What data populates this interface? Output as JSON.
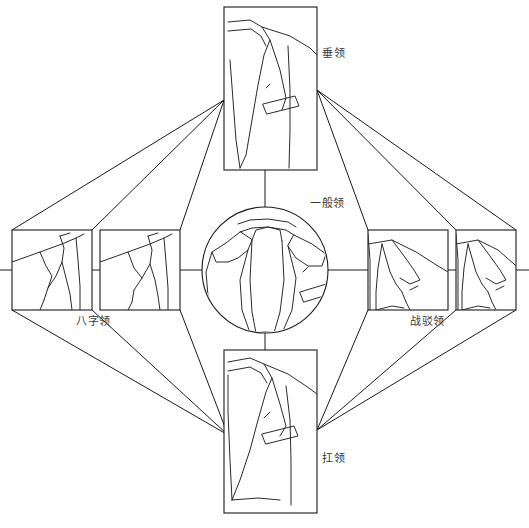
{
  "diagram": {
    "background_color": "#ffffff",
    "line_color": "#1a1a1a",
    "label_color": "#3a3a3a",
    "center": {
      "id": "center-node",
      "label": "一般领",
      "shape": "circle",
      "cx": 265,
      "cy": 270,
      "r": 63,
      "label_x": 310,
      "label_y": 203
    },
    "nodes": [
      {
        "id": "node-top",
        "label": "垂领",
        "shape": "rect",
        "x": 224,
        "y": 7,
        "w": 93,
        "h": 163,
        "label_x": 322,
        "label_y": 57
      },
      {
        "id": "node-bottom",
        "label": "扛领",
        "shape": "rect",
        "x": 224,
        "y": 350,
        "w": 93,
        "h": 163,
        "label_x": 322,
        "label_y": 462
      },
      {
        "id": "node-left-outer",
        "label": "八字领",
        "shape": "rect",
        "x": 12,
        "y": 230,
        "w": 80,
        "h": 80,
        "label_x": 80,
        "label_y": 325
      },
      {
        "id": "node-left-inner",
        "label": "",
        "shape": "rect",
        "x": 100,
        "y": 230,
        "w": 80,
        "h": 80,
        "label_x": 0,
        "label_y": 0
      },
      {
        "id": "node-right-inner",
        "label": "",
        "shape": "rect",
        "x": 368,
        "y": 230,
        "w": 80,
        "h": 80,
        "label_x": 0,
        "label_y": 0
      },
      {
        "id": "node-right-outer",
        "label": "战驳领",
        "shape": "rect",
        "x": 456,
        "y": 230,
        "w": 60,
        "h": 80,
        "label_x": 412,
        "label_y": 325
      }
    ],
    "labels": {
      "top": "垂领",
      "center": "一般领",
      "left": "八字领",
      "right": "战驳领",
      "bottom": "扛领"
    },
    "connectors": [
      {
        "id": "conn-center-top",
        "from": "center-node",
        "to": "node-top",
        "x1": 265,
        "y1": 207,
        "x2": 265,
        "y2": 170
      },
      {
        "id": "conn-center-bottom",
        "from": "center-node",
        "to": "node-bottom",
        "x1": 265,
        "y1": 333,
        "x2": 265,
        "y2": 350
      },
      {
        "id": "conn-center-left",
        "from": "center-node",
        "to": "node-left-inner",
        "x1": 202,
        "y1": 270,
        "x2": 180,
        "y2": 270
      },
      {
        "id": "conn-center-right",
        "from": "center-node",
        "to": "node-right-inner",
        "x1": 328,
        "y1": 270,
        "x2": 368,
        "y2": 270
      },
      {
        "id": "conn-left-pair",
        "from": "node-left-inner",
        "to": "node-left-outer",
        "x1": 100,
        "y1": 270,
        "x2": 92,
        "y2": 270
      },
      {
        "id": "conn-right-pair",
        "from": "node-right-inner",
        "to": "node-right-outer",
        "x1": 448,
        "y1": 270,
        "x2": 456,
        "y2": 270
      },
      {
        "id": "conn-left-edge",
        "from": "node-left-outer",
        "to": "edge",
        "x1": 12,
        "y1": 270,
        "x2": 0,
        "y2": 270
      },
      {
        "id": "conn-right-edge",
        "from": "node-right-outer",
        "to": "edge",
        "x1": 516,
        "y1": 270,
        "x2": 529,
        "y2": 270
      }
    ],
    "rays": [
      {
        "id": "ray-top-left-a",
        "x1": 224,
        "y1": 100,
        "x2": 92,
        "y2": 230
      },
      {
        "id": "ray-top-left-b",
        "x1": 224,
        "y1": 100,
        "x2": 180,
        "y2": 230
      },
      {
        "id": "ray-top-left-c",
        "x1": 224,
        "y1": 100,
        "x2": 12,
        "y2": 230
      },
      {
        "id": "ray-top-right-a",
        "x1": 317,
        "y1": 90,
        "x2": 368,
        "y2": 230
      },
      {
        "id": "ray-top-right-b",
        "x1": 317,
        "y1": 90,
        "x2": 456,
        "y2": 230
      },
      {
        "id": "ray-top-right-c",
        "x1": 317,
        "y1": 90,
        "x2": 516,
        "y2": 230
      },
      {
        "id": "ray-bot-left-a",
        "x1": 228,
        "y1": 435,
        "x2": 92,
        "y2": 310
      },
      {
        "id": "ray-bot-left-b",
        "x1": 228,
        "y1": 435,
        "x2": 180,
        "y2": 310
      },
      {
        "id": "ray-bot-left-c",
        "x1": 228,
        "y1": 435,
        "x2": 12,
        "y2": 310
      },
      {
        "id": "ray-bot-right-a",
        "x1": 317,
        "y1": 430,
        "x2": 368,
        "y2": 310
      },
      {
        "id": "ray-bot-right-b",
        "x1": 317,
        "y1": 430,
        "x2": 456,
        "y2": 310
      },
      {
        "id": "ray-bot-right-c",
        "x1": 317,
        "y1": 430,
        "x2": 516,
        "y2": 310
      }
    ]
  }
}
